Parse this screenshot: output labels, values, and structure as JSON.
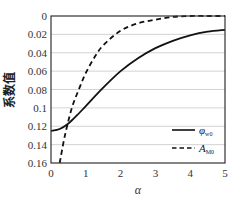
{
  "chart_data": {
    "type": "line",
    "title": "",
    "xlabel": "α",
    "ylabel": "系数值",
    "xlim": [
      0,
      5
    ],
    "ylim": [
      0.16,
      0
    ],
    "y_inverted": true,
    "xticks": [
      "0",
      "1",
      "2",
      "3",
      "4",
      "5"
    ],
    "yticks": [
      "0",
      "0.02",
      "0.04",
      "0.06",
      "0.08",
      "0.1",
      "0.12",
      "0.14",
      "0.16"
    ],
    "grid": "horizontal",
    "legend_position": "lower right",
    "series": [
      {
        "name": "φ_w0",
        "label_main": "φ",
        "label_sub": "w0",
        "style": "solid",
        "x": [
          0,
          0.25,
          0.5,
          0.75,
          1,
          1.5,
          2,
          2.5,
          3,
          3.5,
          4,
          4.5,
          5
        ],
        "y": [
          0.125,
          0.123,
          0.117,
          0.108,
          0.098,
          0.078,
          0.06,
          0.046,
          0.035,
          0.027,
          0.021,
          0.017,
          0.015
        ]
      },
      {
        "name": "A_M0",
        "label_main": "A",
        "label_sub": "M0",
        "style": "dashed",
        "x": [
          0.25,
          0.4,
          0.6,
          0.8,
          1,
          1.25,
          1.5,
          2,
          2.5,
          3,
          3.5,
          4,
          4.5,
          5
        ],
        "y": [
          0.16,
          0.13,
          0.1,
          0.08,
          0.062,
          0.045,
          0.032,
          0.016,
          0.008,
          0.004,
          0.001,
          0.0,
          0.0,
          0.0
        ]
      }
    ]
  }
}
